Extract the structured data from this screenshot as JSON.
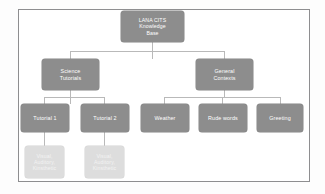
{
  "diagram": {
    "type": "tree",
    "title_text": "LANA CITS Knowledge Base",
    "frame": {
      "border_color": "#8e8e90"
    },
    "colors": {
      "node_dark": "#8d8d8d",
      "node_light": "#dddddd",
      "node_dark_text": "#ffffff",
      "node_light_text": "#f3f3f3",
      "connector": "#b9b9b9",
      "background": "#ffffff"
    },
    "levels": {
      "root": {
        "label": "LANA CITS\nKnowledge\nBase"
      },
      "branches": [
        {
          "label": "Science\nTutorials"
        },
        {
          "label": "General\nContexts"
        }
      ],
      "leaves": [
        {
          "label": "Tutorial 1"
        },
        {
          "label": "Tutorial 2"
        },
        {
          "label": "Weather"
        },
        {
          "label": "Rude words"
        },
        {
          "label": "Greeting"
        }
      ],
      "modalities": [
        {
          "label": "Visual,\nAuditory,\nKinsthetic"
        },
        {
          "label": "Visual,\nAuditory,\nKinsthetic"
        }
      ]
    }
  }
}
